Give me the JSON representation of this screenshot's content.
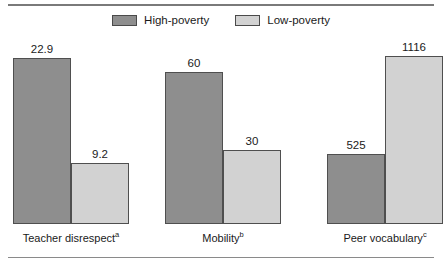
{
  "chart_data": {
    "type": "bar",
    "title": "",
    "subtitle": "",
    "xlabel": "",
    "ylabel": "",
    "grid": false,
    "legend_position": "top-center",
    "note": "Each category is plotted on its own independent scale; bar heights are normalized within each group.",
    "categories": [
      "Teacher disrespect",
      "Mobility",
      "Peer vocabulary"
    ],
    "category_markers": [
      "a",
      "b",
      "c"
    ],
    "series": [
      {
        "name": "High-poverty",
        "color": "#8e8e8e",
        "values": [
          22.9,
          60,
          525
        ],
        "value_labels": [
          "22.9",
          "60",
          "525"
        ]
      },
      {
        "name": "Low-poverty",
        "color": "#d2d2d2",
        "values": [
          9.2,
          30,
          1116
        ],
        "value_labels": [
          "9.2",
          "30",
          "1116"
        ]
      }
    ]
  },
  "legend": {
    "items": [
      {
        "label": "High-poverty",
        "color": "#8e8e8e"
      },
      {
        "label": "Low-poverty",
        "color": "#d2d2d2"
      }
    ]
  },
  "groups": [
    {
      "label": "Teacher disrespect",
      "marker": "a",
      "bars": [
        {
          "series": "High-poverty",
          "value_label": "22.9",
          "height_px": 166,
          "tone": "high"
        },
        {
          "series": "Low-poverty",
          "value_label": "9.2",
          "height_px": 61,
          "tone": "low"
        }
      ]
    },
    {
      "label": "Mobility",
      "marker": "b",
      "bars": [
        {
          "series": "High-poverty",
          "value_label": "60",
          "height_px": 152,
          "tone": "high"
        },
        {
          "series": "Low-poverty",
          "value_label": "30",
          "height_px": 74,
          "tone": "low"
        }
      ]
    },
    {
      "label": "Peer vocabulary",
      "marker": "c",
      "bars": [
        {
          "series": "High-poverty",
          "value_label": "525",
          "height_px": 70,
          "tone": "high"
        },
        {
          "series": "Low-poverty",
          "value_label": "1116",
          "height_px": 168,
          "tone": "low"
        }
      ]
    }
  ],
  "layout": {
    "group_left_px": [
      13,
      165,
      327
    ],
    "bar_width_px": 58
  }
}
